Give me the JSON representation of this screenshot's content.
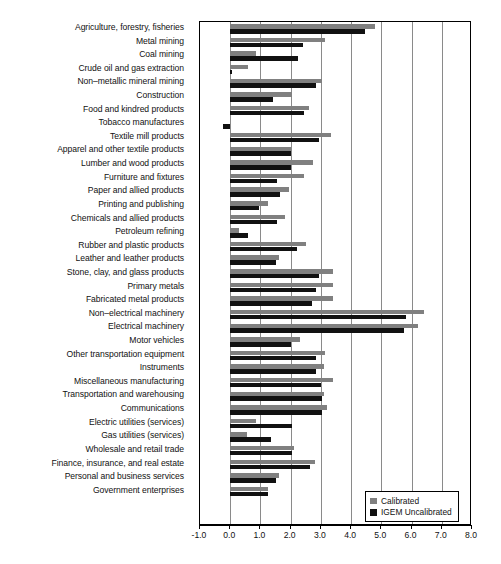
{
  "chart_data": {
    "type": "bar",
    "orientation": "horizontal",
    "title": "",
    "subtitle": "",
    "xlabel": "",
    "ylabel": "",
    "xlim": [
      -1.0,
      8.0
    ],
    "xticks": [
      "-1.0",
      "0.0",
      "1.0",
      "2.0",
      "3.0",
      "4.0",
      "5.0",
      "6.0",
      "7.0",
      "8.0"
    ],
    "xtick_values": [
      -1.0,
      0.0,
      1.0,
      2.0,
      3.0,
      4.0,
      5.0,
      6.0,
      7.0,
      8.0
    ],
    "grid": "vertical",
    "legend_position": "bottom-right",
    "categories": [
      "Agriculture, forestry, fisheries",
      "Metal mining",
      "Coal mining",
      "Crude oil and gas extraction",
      "Non–metallic mineral mining",
      "Construction",
      "Food and kindred products",
      "Tobacco manufactures",
      "Textile mill products",
      "Apparel and other textile products",
      "Lumber and wood products",
      "Furniture and fixtures",
      "Paper and allied products",
      "Printing and publishing",
      "Chemicals and allied products",
      "Petroleum refining",
      "Rubber and plastic products",
      "Leather and leather products",
      "Stone, clay, and glass products",
      "Primary metals",
      "Fabricated metal products",
      "Non–electrical machinery",
      "Electrical machinery",
      "Motor vehicles",
      "Other transportation equipment",
      "Instruments",
      "Miscellaneous manufacturing",
      "Transportation and warehousing",
      "Communications",
      "Electric utilities (services)",
      "Gas utilities (services)",
      "Wholesale and retail trade",
      "Finance, insurance, and real estate",
      "Personal and business services",
      "Government enterprises"
    ],
    "series": [
      {
        "name": "Calibrated",
        "color": "#808080",
        "values": [
          4.8,
          3.15,
          0.85,
          0.6,
          3.05,
          2.05,
          2.6,
          0.0,
          3.35,
          2.0,
          2.75,
          2.45,
          1.95,
          1.25,
          1.8,
          0.3,
          2.5,
          1.6,
          3.4,
          3.4,
          3.4,
          6.4,
          6.2,
          2.3,
          3.15,
          3.1,
          3.4,
          3.1,
          3.2,
          0.85,
          0.55,
          2.1,
          2.8,
          1.6,
          1.25
        ]
      },
      {
        "name": "IGEM Uncalibrated",
        "color": "#111111",
        "values": [
          4.45,
          2.4,
          2.25,
          0.05,
          2.85,
          1.4,
          2.45,
          -0.25,
          2.95,
          2.0,
          2.0,
          1.55,
          1.65,
          0.95,
          1.55,
          0.6,
          2.2,
          1.5,
          2.95,
          2.85,
          2.7,
          5.8,
          5.75,
          2.0,
          2.85,
          2.85,
          3.0,
          3.05,
          3.05,
          2.05,
          1.35,
          2.05,
          2.65,
          1.5,
          1.25
        ]
      }
    ]
  },
  "legend": {
    "items": [
      {
        "label": "Calibrated",
        "swatch": "gray-square-swatch"
      },
      {
        "label": "IGEM Uncalibrated",
        "swatch": "black-square-swatch"
      }
    ]
  },
  "caption": {
    "text": ""
  }
}
